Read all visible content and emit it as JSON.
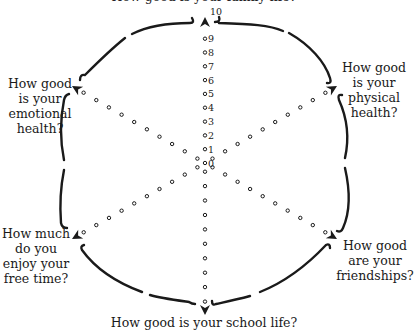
{
  "diagram": {
    "type": "wellbeing-wheel",
    "top_label_partial": "How good is your family life?",
    "scale": {
      "min": 0,
      "max": 10,
      "ticks": [
        "0",
        "1",
        "2",
        "3",
        "4",
        "5",
        "6",
        "7",
        "8",
        "9",
        "10"
      ]
    },
    "spokes": [
      {
        "id": "top",
        "label": "How good is your family life?"
      },
      {
        "id": "upper-right",
        "label_lines": [
          "How good",
          "is your",
          "physical",
          "health?"
        ]
      },
      {
        "id": "lower-right",
        "label_lines": [
          "How good",
          "are your",
          "friendships?"
        ]
      },
      {
        "id": "bottom",
        "label": "How good is your school life?"
      },
      {
        "id": "lower-left",
        "label_lines": [
          "How much",
          "do you",
          "enjoy your",
          "free time?"
        ]
      },
      {
        "id": "upper-left",
        "label_lines": [
          "How good",
          "is your",
          "emotional",
          "health?"
        ]
      }
    ],
    "colors": {
      "ink": "#1a1a1a",
      "background": "#ffffff"
    }
  }
}
